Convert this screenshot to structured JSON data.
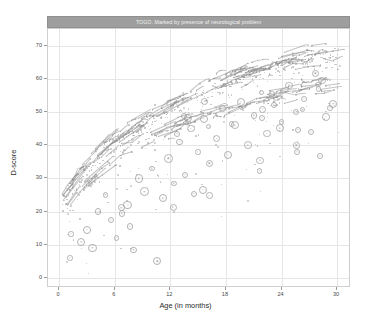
{
  "chart_data": {
    "type": "scatter",
    "title": "TOGO. Marked by presence of neurological problem",
    "xlabel": "Age (in months)",
    "ylabel": "D-score",
    "xlim": [
      -1.2,
      31.5
    ],
    "ylim": [
      -3,
      75
    ],
    "xticks": [
      0,
      6,
      12,
      18,
      24,
      30
    ],
    "yticks": [
      0,
      10,
      20,
      30,
      40,
      50,
      60,
      70
    ],
    "grid": true,
    "legend": "none",
    "point_color": "#8f8f8f",
    "line_color": "#8a8a8a",
    "highlight_color": "#9a9a9a",
    "strip_color": "#9e9e9e",
    "series": [
      {
        "name": "reference-band-upper",
        "comment": "main dense growth trajectory band",
        "x": [
          0.3,
          0.9,
          1.5,
          2.1,
          2.7,
          3.3,
          3.9,
          4.5,
          5.1,
          5.7,
          6.3,
          6.9,
          7.5,
          8.1,
          8.7,
          9.3,
          9.9,
          10.5,
          11.1,
          11.7,
          12.3,
          13.0,
          13.8,
          14.6,
          15.4,
          16.2,
          17.0,
          18.0,
          19.0,
          20.0,
          21.0,
          22.0,
          23.0,
          24.0,
          25.0,
          26.0,
          27.0,
          28.0,
          29.0,
          30.0
        ],
        "y": [
          23.5,
          26.0,
          28.5,
          30.5,
          32.5,
          34.2,
          36.0,
          37.5,
          39.0,
          40.3,
          41.6,
          42.8,
          44.0,
          45.1,
          46.2,
          47.2,
          48.2,
          49.1,
          50.0,
          50.9,
          51.8,
          53.0,
          54.2,
          55.3,
          56.3,
          57.2,
          58.1,
          59.2,
          60.3,
          61.3,
          62.2,
          63.0,
          63.8,
          64.5,
          65.2,
          65.9,
          66.5,
          67.1,
          67.6,
          68.1
        ]
      },
      {
        "name": "reference-band-lower",
        "comment": "second parallel trajectory band slightly below",
        "x": [
          0.4,
          1.2,
          2.0,
          2.8,
          3.6,
          4.4,
          5.2,
          6.0,
          6.8,
          7.6,
          8.4,
          9.2,
          10.0,
          11.0,
          12.0,
          13.0,
          14.0,
          15.0,
          16.0,
          17.0,
          18.0,
          19.5,
          21.0,
          22.5,
          24.0,
          25.5,
          27.0,
          28.5,
          30.0
        ],
        "y": [
          22.0,
          25.0,
          27.8,
          30.2,
          32.4,
          34.4,
          36.2,
          37.9,
          39.4,
          40.8,
          42.1,
          43.3,
          44.4,
          45.7,
          46.9,
          48.0,
          49.0,
          50.0,
          50.9,
          51.8,
          52.6,
          53.9,
          55.1,
          56.2,
          57.2,
          58.1,
          59.0,
          59.8,
          60.5
        ]
      },
      {
        "name": "marked-neurological-problem",
        "comment": "highlighted circled observations lying below the reference band",
        "x": [
          1.2,
          2.4,
          3.0,
          3.6,
          4.2,
          5.0,
          5.6,
          6.2,
          6.8,
          7.4,
          8.0,
          8.6,
          9.2,
          10.0,
          10.6,
          11.2,
          11.8,
          12.4,
          13.0,
          13.6,
          14.2,
          15.0,
          15.6,
          16.2,
          17.0,
          17.6,
          18.2,
          19.0,
          19.6,
          20.4,
          21.0,
          21.8,
          22.4,
          23.2,
          24.0,
          24.8,
          25.6,
          26.4,
          27.2,
          28.0,
          28.8,
          29.6
        ],
        "y": [
          6.0,
          11.0,
          14.5,
          9.0,
          20.0,
          25.0,
          17.5,
          12.0,
          19.5,
          22.0,
          8.5,
          30.0,
          26.0,
          33.0,
          5.0,
          24.0,
          36.0,
          28.5,
          41.0,
          31.0,
          45.0,
          38.0,
          48.0,
          34.5,
          42.0,
          51.0,
          37.0,
          46.0,
          53.0,
          40.0,
          49.0,
          56.0,
          43.5,
          52.0,
          47.0,
          58.0,
          50.0,
          54.0,
          44.0,
          57.0,
          48.5,
          52.5
        ]
      }
    ]
  },
  "panel": {
    "strip_title": "TOGO. Marked by presence of neurological problem",
    "x_tick_labels": [
      "0",
      "6",
      "12",
      "18",
      "24",
      "30"
    ],
    "y_tick_labels": [
      "0",
      "10",
      "20",
      "30",
      "40",
      "50",
      "60",
      "70"
    ],
    "x_axis_title": "Age (in months)",
    "y_axis_title": "D-score"
  }
}
